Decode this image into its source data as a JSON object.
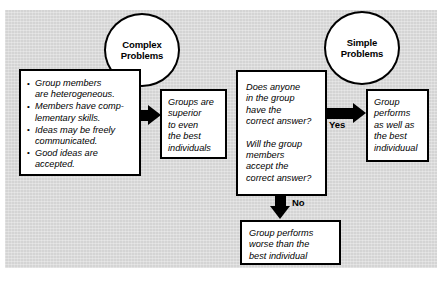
{
  "figure": {
    "panel_color": "#d4d4d4",
    "line_color": "#000000",
    "box_fill": "#ffffff"
  },
  "circles": [
    {
      "id": "complex",
      "line1": "Complex",
      "line2": "Problems"
    },
    {
      "id": "simple",
      "line1": "Simple",
      "line2": "Problems"
    }
  ],
  "boxes": {
    "bullets": {
      "items": [
        "Group members\nare heterogeneous.",
        "Members have comp-\nlementary skills.",
        "Ideas may be freely\ncommunicated.",
        "Good ideas are\naccepted."
      ]
    },
    "superior": {
      "text": "Groups are\nsuperior\nto even\nthe best\nindividuals"
    },
    "decision": {
      "question1": "Does anyone\nin the group\nhave the\ncorrect answer?",
      "question2": "Will the group\nmembers\naccept the\ncorrect answer?"
    },
    "yes_outcome": {
      "text": "Group\nperforms\nas well as\nthe best\nindividuual"
    },
    "no_outcome": {
      "text": "Group performs\nworse than the\nbest individual"
    }
  },
  "edge_labels": {
    "yes": "Yes",
    "no": "No"
  }
}
